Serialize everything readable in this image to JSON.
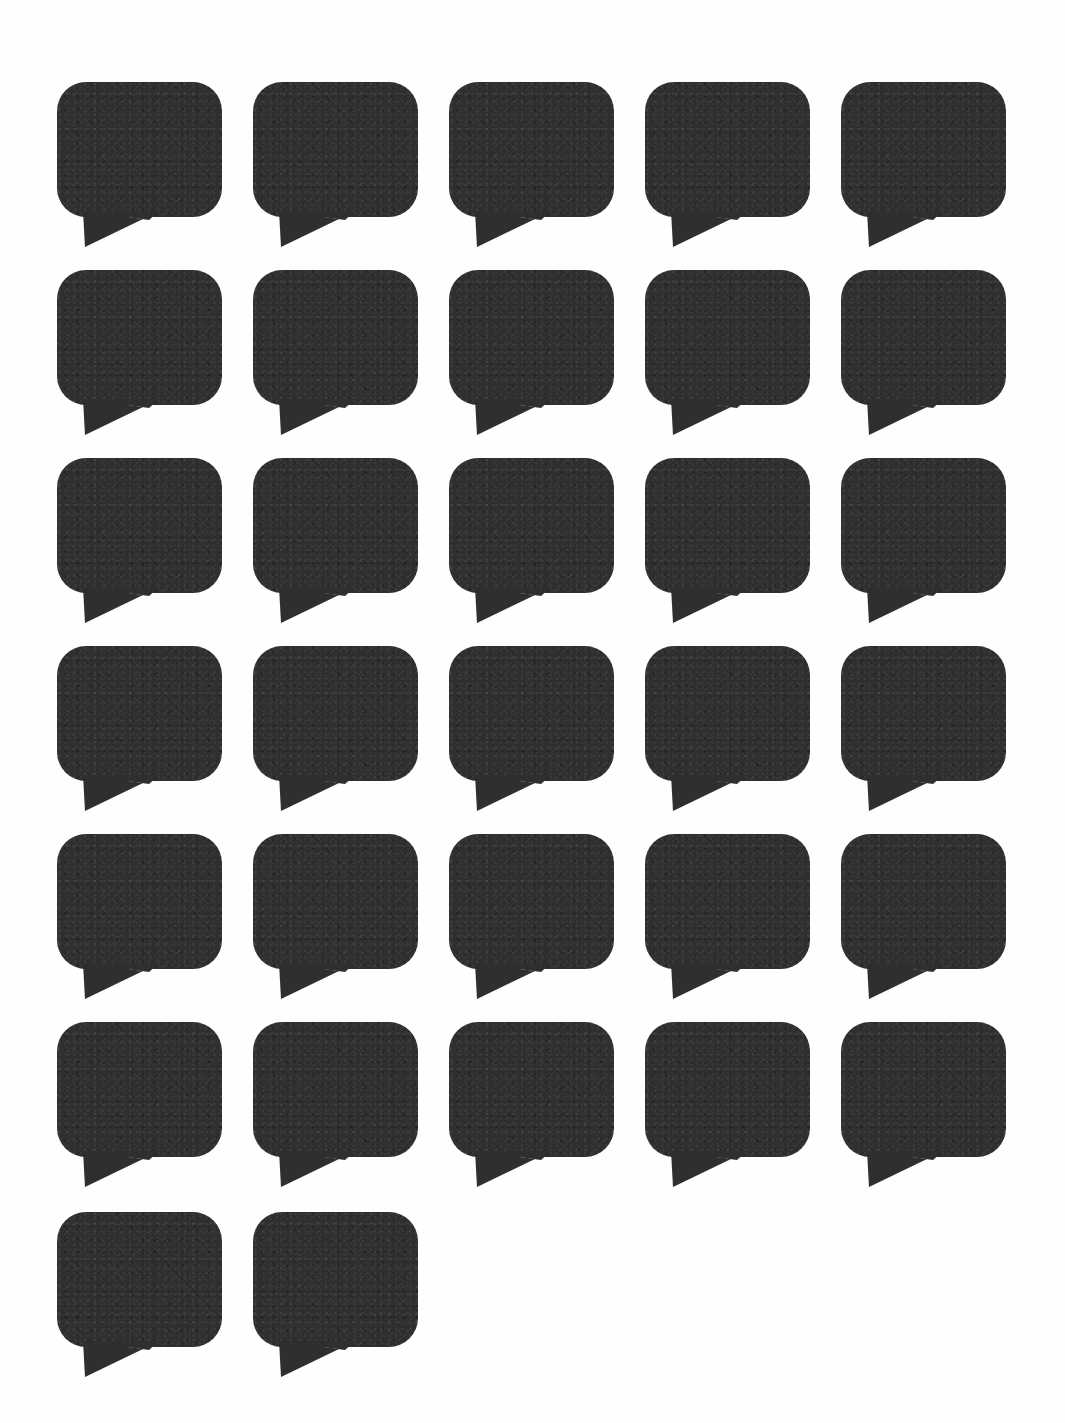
{
  "page": {
    "background_color": "#ffffff",
    "width": 1065,
    "height": 1423
  },
  "sheet": {
    "shape_name": "speech-bubble",
    "fill_color": "#2f2f2f",
    "total_shapes": 32,
    "columns": 5,
    "rows": 7,
    "bubble_width": 165,
    "bubble_height": 135,
    "corner_radius": 29,
    "column_pitch": 196,
    "row_pitch": 188,
    "tail_direction": "down-left",
    "tail_width": 76,
    "tail_height": 36,
    "column_left_offsets": [
      57,
      253,
      449,
      645,
      841
    ],
    "row_top_offsets": [
      82,
      270,
      458,
      646,
      834,
      1022,
      1212
    ],
    "grid": [
      {
        "row_index": 0,
        "count": 5,
        "label": "row-1"
      },
      {
        "row_index": 1,
        "count": 5,
        "label": "row-2"
      },
      {
        "row_index": 2,
        "count": 5,
        "label": "row-3"
      },
      {
        "row_index": 3,
        "count": 5,
        "label": "row-4"
      },
      {
        "row_index": 4,
        "count": 5,
        "label": "row-5"
      },
      {
        "row_index": 5,
        "count": 5,
        "label": "row-6"
      },
      {
        "row_index": 6,
        "count": 2,
        "label": "row-7"
      }
    ],
    "bubble_labels": [
      "bubble-1",
      "bubble-2",
      "bubble-3",
      "bubble-4",
      "bubble-5",
      "bubble-6",
      "bubble-7",
      "bubble-8",
      "bubble-9",
      "bubble-10",
      "bubble-11",
      "bubble-12",
      "bubble-13",
      "bubble-14",
      "bubble-15",
      "bubble-16",
      "bubble-17",
      "bubble-18",
      "bubble-19",
      "bubble-20",
      "bubble-21",
      "bubble-22",
      "bubble-23",
      "bubble-24",
      "bubble-25",
      "bubble-26",
      "bubble-27",
      "bubble-28",
      "bubble-29",
      "bubble-30",
      "bubble-31",
      "bubble-32"
    ]
  }
}
